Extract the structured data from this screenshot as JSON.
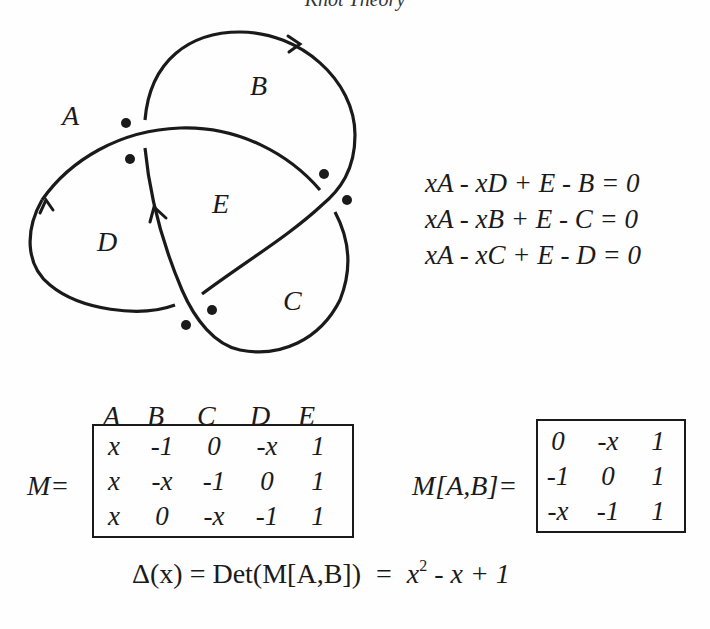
{
  "running_head": "Knot Theory",
  "figure": {
    "region_labels": {
      "A": "A",
      "B": "B",
      "C": "C",
      "D": "D",
      "E": "E"
    },
    "crossing_dots": 8,
    "stroke_color": "#1a1a1a"
  },
  "equations": [
    "xA - xD + E - B = 0",
    "xA - xB + E - C = 0",
    "xA - xC + E - D = 0"
  ],
  "matrix_M": {
    "label": "M=",
    "column_headers": [
      "A",
      "B",
      "C",
      "D",
      "E"
    ],
    "rows": [
      [
        "x",
        "-1",
        "0",
        "-x",
        "1"
      ],
      [
        "x",
        "-x",
        "-1",
        "0",
        "1"
      ],
      [
        "x",
        "0",
        "-x",
        "-1",
        "1"
      ]
    ]
  },
  "matrix_MAB": {
    "label": "M[A,B]=",
    "rows": [
      [
        "0",
        "-x",
        "1"
      ],
      [
        "-1",
        "0",
        "1"
      ],
      [
        "-x",
        "-1",
        "1"
      ]
    ]
  },
  "determinant": {
    "lhs": "Δ(x) = Det(M[A,B])",
    "equals": "=",
    "rhs_base": "x",
    "rhs_exp": "2",
    "rhs_rest": " - x + 1"
  }
}
